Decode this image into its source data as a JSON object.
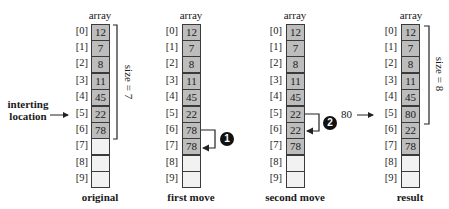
{
  "array_title": "array",
  "indices": [
    "[0]",
    "[1]",
    "[2]",
    "[3]",
    "[4]",
    "[5]",
    "[6]",
    "[7]",
    "[8]",
    "[9]"
  ],
  "columns": [
    {
      "id": "original",
      "caption": "original",
      "values": [
        "12",
        "7",
        "8",
        "11",
        "45",
        "22",
        "78",
        "",
        "",
        ""
      ],
      "size_label": "size = 7"
    },
    {
      "id": "first-move",
      "caption": "first move",
      "values": [
        "12",
        "7",
        "8",
        "11",
        "45",
        "22",
        "78",
        "78",
        "",
        ""
      ],
      "step": "1"
    },
    {
      "id": "second-move",
      "caption": "second move",
      "values": [
        "12",
        "7",
        "8",
        "11",
        "45",
        "22",
        "22",
        "78",
        "",
        ""
      ],
      "step": "2"
    },
    {
      "id": "result",
      "caption": "result",
      "values": [
        "12",
        "7",
        "8",
        "11",
        "45",
        "80",
        "22",
        "78",
        "",
        ""
      ],
      "size_label": "size = 8"
    }
  ],
  "insert_label_line1": "interting",
  "insert_label_line2": "location",
  "insert_value": "80",
  "colors": {
    "filled": "#bdbdbd",
    "empty": "#f2f2f2",
    "border": "#3a3a3a",
    "step_badge": "#111111"
  }
}
